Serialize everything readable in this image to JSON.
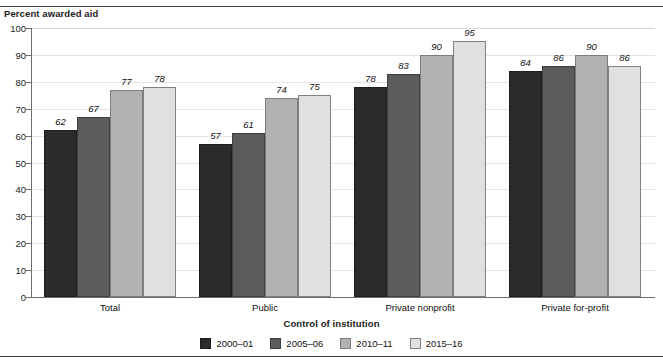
{
  "chart_data": {
    "type": "bar",
    "title": "",
    "xlabel": "Control of institution",
    "ylabel": "Percent awarded aid",
    "ylim": [
      0,
      100
    ],
    "ytick_step": 10,
    "yticks": [
      0,
      10,
      20,
      30,
      40,
      50,
      60,
      70,
      80,
      90,
      100
    ],
    "grid": true,
    "legend_position": "bottom-center",
    "categories": [
      "Total",
      "Public",
      "Private nonprofit",
      "Private for-profit"
    ],
    "series": [
      {
        "name": "2000–01",
        "color": "#2b2b2b",
        "values": [
          62,
          57,
          78,
          84
        ]
      },
      {
        "name": "2005–06",
        "color": "#5c5c5c",
        "values": [
          67,
          61,
          83,
          86
        ]
      },
      {
        "name": "2010–11",
        "color": "#b2b2b2",
        "values": [
          77,
          74,
          90,
          90
        ]
      },
      {
        "name": "2015–16",
        "color": "#e0e0e0",
        "values": [
          78,
          75,
          95,
          86
        ]
      }
    ],
    "data_labels": [
      [
        62,
        67,
        77,
        78
      ],
      [
        57,
        61,
        74,
        75
      ],
      [
        78,
        83,
        90,
        95
      ],
      [
        84,
        86,
        90,
        86
      ]
    ]
  },
  "legend": {
    "title": "Control of institution",
    "items": [
      {
        "label": "2000–01"
      },
      {
        "label": "2005–06"
      },
      {
        "label": "2010–11"
      },
      {
        "label": "2015–16"
      }
    ]
  },
  "axes": {
    "y_title": "Percent awarded aid",
    "x_title": "Control of institution",
    "y_labels": [
      "100",
      "90",
      "80",
      "70",
      "60",
      "50",
      "40",
      "30",
      "20",
      "10",
      "0"
    ],
    "x_labels": [
      "Total",
      "Public",
      "Private nonprofit",
      "Private for-profit"
    ]
  }
}
